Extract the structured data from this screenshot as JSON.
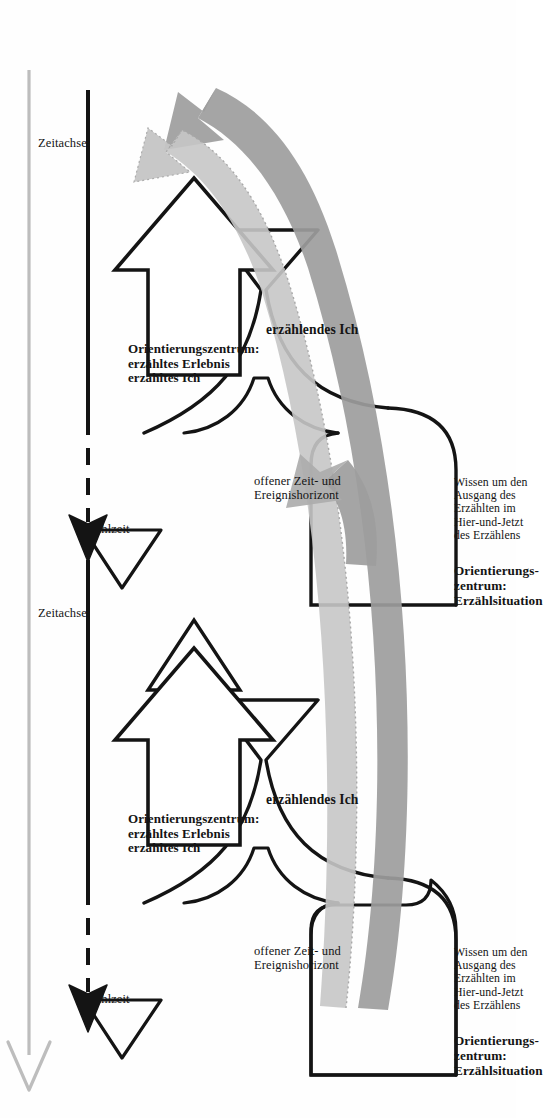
{
  "figure": {
    "language": "de",
    "orientation_deg": 90,
    "colors": {
      "ink": "#141414",
      "gray_ribbon": "#9a9a9a",
      "gray_ribbon_light": "#c3c3c3",
      "timeline_gray": "#b9b9b9",
      "background": "#fefefe"
    }
  },
  "units": [
    {
      "id": "unit-1",
      "situation_box": {
        "knowledge_text": "Wissen um den\nAusgang des\nErzählten im\nHier-und-Jetzt\ndes Erzählens",
        "orientation_label": "Orientierungs-\nzentrum:\nErzählsituation"
      },
      "narrating_self_label": "erzählendes Ich",
      "big_arrow_label": "Orientierungszentrum:\nerzähltes Erlebnis\nerzähltes Ich",
      "horizon_label": "offener Zeit- und\nEreignishorizont",
      "narration_time_label": "Erzählzeit",
      "time_axis_label": "Zeitachse"
    },
    {
      "id": "unit-2",
      "situation_box": {
        "knowledge_text": "Wissen um den\nAusgang des\nErzählten im\nHier-und-Jetzt\ndes Erzählens",
        "orientation_label": "Orientierungs-\nzentrum:\nErzählsituation"
      },
      "narrating_self_label": "erzählendes Ich",
      "big_arrow_label": "Orientierungszentrum:\nerzähltes Erlebnis\nerzähltes Ich",
      "horizon_label": "offener Zeit- und\nEreignishorizont",
      "narration_time_label": "Erzählzeit",
      "time_axis_label": "Zeitachse"
    }
  ],
  "icons": {
    "triangle": "erzaehlzeit-triangle-icon",
    "arrowhead": "timeline-arrowhead-icon",
    "ribbon": "gray-feedback-arrow-icon",
    "big_arrow": "upward-block-arrow-icon"
  }
}
